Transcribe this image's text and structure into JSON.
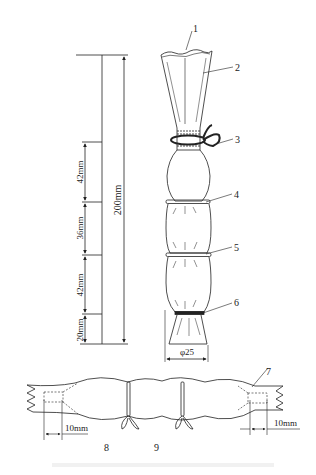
{
  "figure": {
    "type": "technical-diagram",
    "colors": {
      "line": "#222222",
      "background": "#ffffff",
      "caption_faded": "#f1f1f1"
    },
    "vertical_view": {
      "dimensions": {
        "total": "200mm",
        "segments": [
          "42mm",
          "36mm",
          "42mm",
          "20mm"
        ]
      },
      "diameter": "φ25",
      "callouts": [
        "1",
        "2",
        "3",
        "4",
        "5",
        "6"
      ]
    },
    "horizontal_view": {
      "callouts": [
        "7",
        "8",
        "9"
      ],
      "left_dimension": "10mm",
      "right_dimension": "10mm"
    }
  }
}
